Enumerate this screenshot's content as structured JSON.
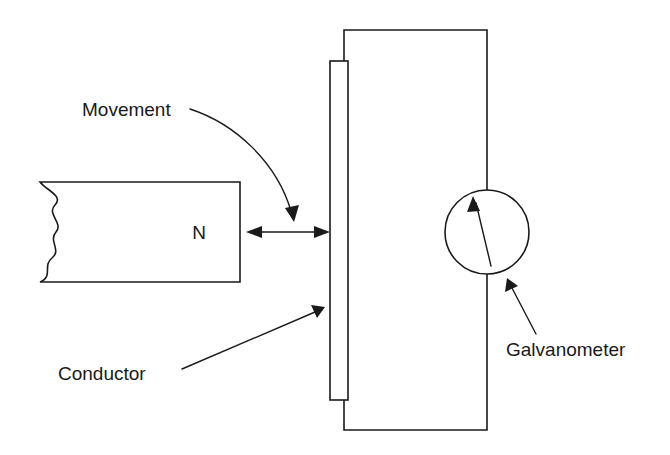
{
  "figure": {
    "background_color": "#ffffff",
    "line_color": "#1a1a1a",
    "width": 670,
    "height": 455
  },
  "labels": {
    "movement": "Movement",
    "conductor": "Conductor",
    "galvanometer": "Galvanometer",
    "magnet_pole": "N"
  },
  "components": {
    "magnet": {
      "name": "bar-magnet",
      "pole_label": "N",
      "left_edge_style": "wavy-break",
      "rect": {
        "x": 38,
        "y": 182,
        "width": 202,
        "height": 100
      }
    },
    "conductor_bar": {
      "name": "conductor-bar",
      "rect": {
        "x": 330,
        "y": 61,
        "width": 18,
        "height": 339
      }
    },
    "galvanometer": {
      "name": "galvanometer",
      "center": {
        "x": 487,
        "y": 232
      },
      "radius": 42,
      "needle_angle_label": "up-left"
    },
    "circuit_wires": {
      "name": "circuit-loop",
      "top_wire_y": 30,
      "bottom_wire_y": 430,
      "right_wire_x": 487,
      "left_wire_x": 344
    },
    "motion_arrow": {
      "name": "double-headed-motion-arrow",
      "from_x": 248,
      "to_x": 328,
      "y": 232
    }
  },
  "pointers": [
    {
      "name": "movement-pointer",
      "label": "Movement",
      "target": "motion-arrow"
    },
    {
      "name": "conductor-pointer",
      "label": "Conductor",
      "target": "conductor-bar"
    },
    {
      "name": "galvanometer-pointer",
      "label": "Galvanometer",
      "target": "galvanometer"
    }
  ]
}
